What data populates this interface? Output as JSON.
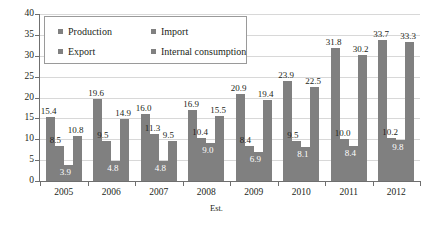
{
  "chart_data": {
    "type": "bar",
    "title": "",
    "xlabel": "Est.",
    "ylabel": "",
    "ylim": [
      0,
      40
    ],
    "ytick_step": 5,
    "yticks": [
      "0",
      "5",
      "10",
      "15",
      "20",
      "25",
      "30",
      "35",
      "40"
    ],
    "grid": true,
    "legend_position": "top-left-inside",
    "categories": [
      "2005",
      "2006",
      "2007",
      "2008",
      "2009",
      "2010",
      "2011",
      "2012"
    ],
    "series": [
      {
        "name": "Production",
        "color": "#808080",
        "values": [
          15.4,
          19.6,
          16.0,
          16.9,
          20.9,
          23.9,
          31.8,
          33.7
        ],
        "labels": [
          "15.4",
          "19.6",
          "16.0",
          "16.9",
          "20.9",
          "23.9",
          "31.8",
          "33.7"
        ]
      },
      {
        "name": "Import",
        "color": "#808080",
        "values": [
          8.5,
          9.5,
          11.3,
          10.4,
          8.4,
          9.5,
          10.0,
          10.2
        ],
        "labels": [
          "8.5",
          "9.5",
          "11.3",
          "10.4",
          "8.4",
          "9.5",
          "10.0",
          "10.2"
        ]
      },
      {
        "name": "Export",
        "color": "#808080",
        "values": [
          3.9,
          4.8,
          4.8,
          9.0,
          6.9,
          8.1,
          8.4,
          9.8
        ],
        "labels": [
          "3.9",
          "4.8",
          "4.8",
          "9.0",
          "6.9",
          "8.1",
          "8.4",
          "9.8"
        ]
      },
      {
        "name": "Internal consumption",
        "color": "#808080",
        "values": [
          10.8,
          14.9,
          9.5,
          15.5,
          19.4,
          22.5,
          30.2,
          33.3
        ],
        "labels": [
          "10.8",
          "14.9",
          "9.5",
          "15.5",
          "19.4",
          "22.5",
          "30.2",
          "33.3"
        ]
      }
    ]
  },
  "legend": {
    "items": [
      {
        "label": "Production"
      },
      {
        "label": "Import"
      },
      {
        "label": "Export"
      },
      {
        "label": "Internal consumption"
      }
    ]
  }
}
